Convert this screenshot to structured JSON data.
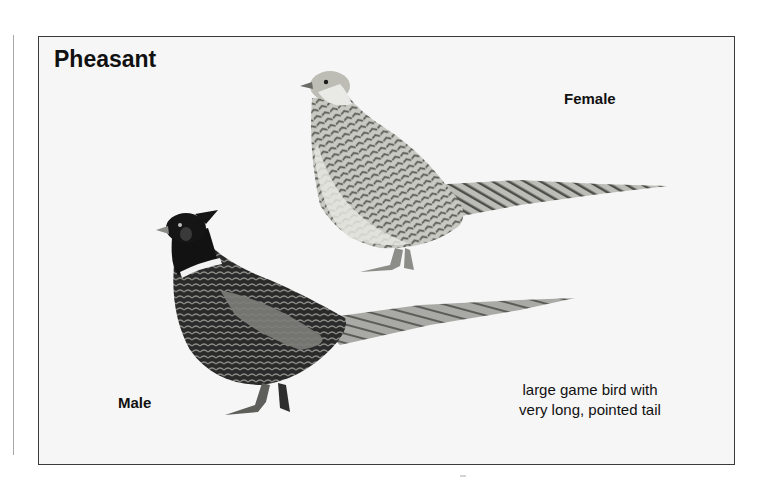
{
  "figure": {
    "title": "Pheasant",
    "labels": {
      "female": "Female",
      "male": "Male"
    },
    "caption": {
      "line1": "large game bird with",
      "line2": "very long, pointed tail"
    },
    "illustrations": [
      {
        "name": "female-pheasant",
        "description": "mottled pale brown-grey female pheasant facing left, long barred tail"
      },
      {
        "name": "male-pheasant",
        "description": "dark male pheasant with ear tufts, white neck ring, scalloped body, very long barred tail"
      }
    ],
    "colors": {
      "frame_border": "#3a3a3a",
      "plate_background": "#f6f6f6",
      "text": "#111111"
    }
  }
}
